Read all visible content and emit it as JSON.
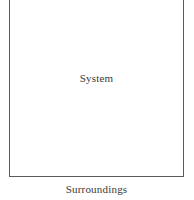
{
  "diagram": {
    "system_label": "System",
    "surroundings_label": "Surroundings",
    "boundary_color": "#5a5a5a"
  }
}
